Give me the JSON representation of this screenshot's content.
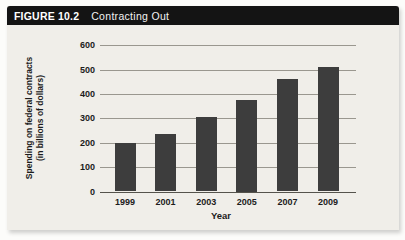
{
  "figure": {
    "label": "FIGURE 10.2",
    "title": "Contracting Out"
  },
  "chart_data": {
    "type": "bar",
    "categories": [
      "1999",
      "2001",
      "2003",
      "2005",
      "2007",
      "2009"
    ],
    "values": [
      200,
      235,
      305,
      375,
      460,
      510
    ],
    "title": "Contracting Out",
    "xlabel": "Year",
    "ylabel": "Spending on federal contracts (in billions of dollars)",
    "ylabel_line1": "Spending on federal contracts",
    "ylabel_line2": "(in billions of dollars)",
    "ylim": [
      0,
      600
    ],
    "ytick_step": 100,
    "yticks": [
      0,
      100,
      200,
      300,
      400,
      500,
      600
    ],
    "grid": true,
    "legend": "none",
    "bar_color": "#3d3d3d",
    "panel_background": "#f0eee9",
    "header_background": "#141414",
    "header_text_color": "#ffffff",
    "gridline_color": "#9a978f"
  }
}
